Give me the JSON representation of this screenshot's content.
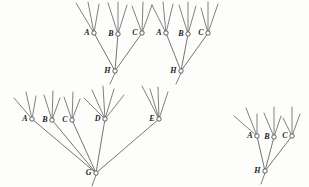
{
  "figure": {
    "width": 309,
    "height": 187,
    "background_color": "#fdfdfb",
    "line_color": "#3a3a3a",
    "label_color": "#1d1d1d",
    "node_fill_color": "#ffffff"
  },
  "nodes": [
    {
      "id": "n1",
      "label": "A",
      "x": 94,
      "y": 33,
      "r": 2.2,
      "label_dx": -4.5,
      "label_dy": 0.5,
      "cluster": "upper-left"
    },
    {
      "id": "n2",
      "label": "B",
      "x": 118,
      "y": 34,
      "r": 2.2,
      "label_dx": -4.5,
      "label_dy": 0.5,
      "cluster": "upper-left"
    },
    {
      "id": "n3",
      "label": "C",
      "x": 142,
      "y": 33,
      "r": 2.2,
      "label_dx": -4.5,
      "label_dy": 0.5,
      "cluster": "upper-left"
    },
    {
      "id": "n4",
      "label": "H",
      "x": 115,
      "y": 71,
      "r": 2.2,
      "label_dx": -4.5,
      "label_dy": 0.5,
      "cluster": "upper-left"
    },
    {
      "id": "n5",
      "label": "A",
      "x": 166,
      "y": 33,
      "r": 2.2,
      "label_dx": -4.5,
      "label_dy": 0.5,
      "cluster": "upper-right"
    },
    {
      "id": "n6",
      "label": "B",
      "x": 188,
      "y": 34,
      "r": 2.2,
      "label_dx": -4.5,
      "label_dy": 0.5,
      "cluster": "upper-right"
    },
    {
      "id": "n7",
      "label": "C",
      "x": 208,
      "y": 33,
      "r": 2.2,
      "label_dx": -4.5,
      "label_dy": 0.5,
      "cluster": "upper-right"
    },
    {
      "id": "n8",
      "label": "H",
      "x": 181,
      "y": 71,
      "r": 2.2,
      "label_dx": -4.5,
      "label_dy": 0.5,
      "cluster": "upper-right"
    },
    {
      "id": "n9",
      "label": "A",
      "x": 32,
      "y": 119,
      "r": 2.2,
      "label_dx": -4.5,
      "label_dy": 0.5,
      "cluster": "lower-left"
    },
    {
      "id": "n10",
      "label": "B",
      "x": 52,
      "y": 120,
      "r": 2.2,
      "label_dx": -4.5,
      "label_dy": 0.5,
      "cluster": "lower-left"
    },
    {
      "id": "n11",
      "label": "C",
      "x": 72,
      "y": 120,
      "r": 2.2,
      "label_dx": -4.5,
      "label_dy": 0.5,
      "cluster": "lower-left"
    },
    {
      "id": "n12",
      "label": "D",
      "x": 105,
      "y": 119,
      "r": 2.2,
      "label_dx": -4.5,
      "label_dy": 0.5,
      "cluster": "lower-left"
    },
    {
      "id": "n13",
      "label": "E",
      "x": 159,
      "y": 119,
      "r": 2.2,
      "label_dx": -4.5,
      "label_dy": 0.5,
      "cluster": "lower-left"
    },
    {
      "id": "n14",
      "label": "G",
      "x": 96,
      "y": 173,
      "r": 2.2,
      "label_dx": -4.5,
      "label_dy": 0.5,
      "cluster": "lower-left"
    },
    {
      "id": "n15",
      "label": "A",
      "x": 257,
      "y": 136,
      "r": 2.2,
      "label_dx": -4.5,
      "label_dy": 0.5,
      "cluster": "right"
    },
    {
      "id": "n16",
      "label": "B",
      "x": 274,
      "y": 137,
      "r": 2.2,
      "label_dx": -4.5,
      "label_dy": 0.5,
      "cluster": "right"
    },
    {
      "id": "n17",
      "label": "C",
      "x": 292,
      "y": 136,
      "r": 2.2,
      "label_dx": -4.5,
      "label_dy": 0.5,
      "cluster": "right"
    },
    {
      "id": "n18",
      "label": "H",
      "x": 265,
      "y": 171,
      "r": 2.2,
      "label_dx": -4.5,
      "label_dy": 0.5,
      "cluster": "right"
    }
  ],
  "edges": [
    {
      "from": "n4",
      "to": "n1",
      "name": "edge-h-a-upper-left"
    },
    {
      "from": "n4",
      "to": "n2",
      "name": "edge-h-b-upper-left"
    },
    {
      "from": "n4",
      "to": "n3",
      "name": "edge-h-c-upper-left"
    },
    {
      "from": "n8",
      "to": "n5",
      "name": "edge-h-a-upper-right"
    },
    {
      "from": "n8",
      "to": "n6",
      "name": "edge-h-b-upper-right"
    },
    {
      "from": "n8",
      "to": "n7",
      "name": "edge-h-c-upper-right"
    },
    {
      "from": "n14",
      "to": "n9",
      "name": "edge-g-a"
    },
    {
      "from": "n14",
      "to": "n10",
      "name": "edge-g-b"
    },
    {
      "from": "n14",
      "to": "n11",
      "name": "edge-g-c"
    },
    {
      "from": "n14",
      "to": "n12",
      "name": "edge-g-d"
    },
    {
      "from": "n14",
      "to": "n13",
      "name": "edge-g-e"
    },
    {
      "from": "n18",
      "to": "n15",
      "name": "edge-h-a-right"
    },
    {
      "from": "n18",
      "to": "n16",
      "name": "edge-h-b-right"
    },
    {
      "from": "n18",
      "to": "n17",
      "name": "edge-h-c-right"
    }
  ],
  "twigs": [
    {
      "node": "n1",
      "ends": [
        [
          76,
          3
        ],
        [
          88,
          2
        ],
        [
          99,
          4
        ]
      ]
    },
    {
      "node": "n2",
      "ends": [
        [
          108,
          3
        ],
        [
          118,
          2
        ],
        [
          127,
          5
        ]
      ]
    },
    {
      "node": "n3",
      "ends": [
        [
          132,
          6
        ],
        [
          143,
          2
        ],
        [
          152,
          5
        ]
      ]
    },
    {
      "node": "n5",
      "ends": [
        [
          152,
          5
        ],
        [
          163,
          2
        ],
        [
          173,
          4
        ]
      ]
    },
    {
      "node": "n6",
      "ends": [
        [
          179,
          5
        ],
        [
          188,
          2
        ],
        [
          196,
          6
        ]
      ]
    },
    {
      "node": "n7",
      "ends": [
        [
          201,
          8
        ],
        [
          208,
          2
        ],
        [
          218,
          4
        ]
      ]
    },
    {
      "node": "n9",
      "ends": [
        [
          14,
          98
        ],
        [
          26,
          92
        ],
        [
          36,
          96
        ]
      ]
    },
    {
      "node": "n10",
      "ends": [
        [
          44,
          95
        ],
        [
          53,
          91
        ],
        [
          60,
          98
        ]
      ]
    },
    {
      "node": "n11",
      "ends": [
        [
          64,
          97
        ],
        [
          73,
          92
        ],
        [
          80,
          99
        ]
      ]
    },
    {
      "node": "n12",
      "ends": [
        [
          84,
          98
        ],
        [
          92,
          90
        ],
        [
          103,
          86
        ],
        [
          114,
          89
        ],
        [
          124,
          95
        ]
      ]
    },
    {
      "node": "n13",
      "ends": [
        [
          142,
          86
        ],
        [
          150,
          89
        ],
        [
          158,
          87
        ],
        [
          168,
          92
        ]
      ]
    },
    {
      "node": "n15",
      "ends": [
        [
          234,
          116
        ],
        [
          246,
          108
        ],
        [
          257,
          114
        ]
      ]
    },
    {
      "node": "n16",
      "ends": [
        [
          264,
          113
        ],
        [
          274,
          107
        ],
        [
          281,
          116
        ]
      ]
    },
    {
      "node": "n17",
      "ends": [
        [
          283,
          118
        ],
        [
          292,
          107
        ],
        [
          300,
          114
        ]
      ]
    }
  ],
  "extra_twigs": [
    {
      "name": "twig-h-left-down",
      "from": [
        115,
        73
      ],
      "to": [
        110,
        84
      ]
    },
    {
      "name": "twig-h-right-down",
      "from": [
        181,
        73
      ],
      "to": [
        176,
        84
      ]
    },
    {
      "name": "twig-g-down",
      "from": [
        96,
        175
      ],
      "to": [
        92,
        186
      ]
    },
    {
      "name": "twig-hr-down",
      "from": [
        265,
        173
      ],
      "to": [
        261,
        184
      ]
    }
  ]
}
